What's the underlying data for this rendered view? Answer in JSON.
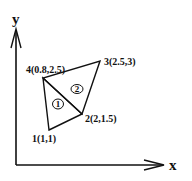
{
  "diagram": {
    "type": "finite-element-mesh",
    "axes": {
      "x_label": "x",
      "y_label": "y"
    },
    "nodes": [
      {
        "id": 1,
        "label": "1(1,1)",
        "x": 1,
        "y": 1
      },
      {
        "id": 2,
        "label": "2(2,1.5)",
        "x": 2,
        "y": 1.5
      },
      {
        "id": 3,
        "label": "3(2.5,3)",
        "x": 2.5,
        "y": 3
      },
      {
        "id": 4,
        "label": "4(0.8,2.5)",
        "x": 0.8,
        "y": 2.5
      }
    ],
    "elements": [
      {
        "id": 1,
        "label": "1",
        "nodes": [
          1,
          2,
          4
        ]
      },
      {
        "id": 2,
        "label": "2",
        "nodes": [
          2,
          3,
          4
        ]
      }
    ],
    "colors": {
      "stroke": "#111111",
      "background": "#ffffff"
    }
  }
}
